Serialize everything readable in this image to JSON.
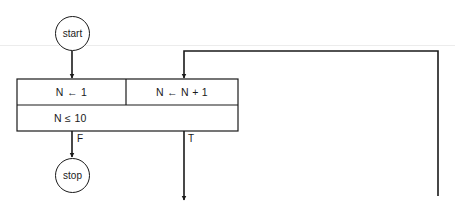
{
  "diagram": {
    "type": "flowchart",
    "colors": {
      "stroke": "#1a1a1a",
      "background": "#ffffff"
    },
    "nodes": {
      "start": {
        "label": "start",
        "shape": "circle"
      },
      "stop": {
        "label": "stop",
        "shape": "circle"
      },
      "loop_box": {
        "init": "N ← 1",
        "increment": "N ← N + 1",
        "condition": "N ≤ 10"
      }
    },
    "edges": {
      "false_label": "F",
      "true_label": "T"
    }
  }
}
